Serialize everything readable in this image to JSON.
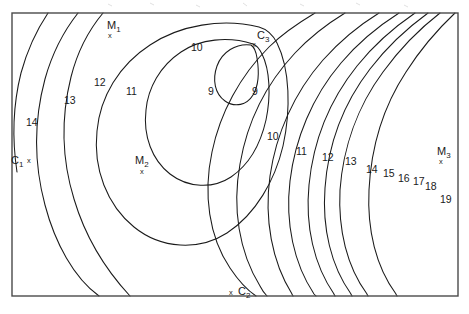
{
  "figure": {
    "type": "contour-map",
    "background_color": "#ffffff",
    "line_color": "#1a1a1a",
    "frame_color": "#4a4a4a",
    "width": 469,
    "height": 314
  },
  "chart_data": {
    "type": "contour",
    "title": "",
    "xlabel": "",
    "ylabel": "",
    "grid": false,
    "legend": "none",
    "axes_visible": false,
    "tick_labels": [],
    "frame": {
      "x": 12,
      "y": 13,
      "width": 446,
      "height": 283
    },
    "contour_levels": [
      9,
      10,
      11,
      12,
      13,
      14,
      15,
      16,
      17,
      18,
      19
    ],
    "level_min": 9,
    "level_max": 19,
    "level_step": 1,
    "inline_labels": [
      {
        "text": "M",
        "sub": "1",
        "x": 107,
        "y": 20,
        "kind": "marker",
        "marker_x": 108,
        "marker_y": 32
      },
      {
        "text": "C",
        "sub": "3",
        "x": 257,
        "y": 30,
        "kind": "marker",
        "marker_x": 252,
        "marker_y": 41
      },
      {
        "text": "C",
        "sub": "1",
        "x": 11,
        "y": 155,
        "kind": "marker",
        "marker_x": 27,
        "marker_y": 157
      },
      {
        "text": "M",
        "sub": "2",
        "x": 135,
        "y": 155,
        "kind": "marker",
        "marker_x": 140,
        "marker_y": 168
      },
      {
        "text": "C",
        "sub": "2",
        "x": 238,
        "y": 286,
        "kind": "marker",
        "marker_x": 229,
        "marker_y": 289
      },
      {
        "text": "M",
        "sub": "3",
        "x": 437,
        "y": 146,
        "kind": "marker",
        "marker_x": 439,
        "marker_y": 158
      },
      {
        "text": "9",
        "sub": "",
        "x": 208,
        "y": 86,
        "kind": "level"
      },
      {
        "text": "9",
        "sub": "",
        "x": 252,
        "y": 86,
        "kind": "level"
      },
      {
        "text": "10",
        "sub": "",
        "x": 191,
        "y": 42,
        "kind": "level"
      },
      {
        "text": "10",
        "sub": "",
        "x": 267,
        "y": 131,
        "kind": "level"
      },
      {
        "text": "11",
        "sub": "",
        "x": 126,
        "y": 86,
        "kind": "level"
      },
      {
        "text": "11",
        "sub": "",
        "x": 296,
        "y": 146,
        "kind": "level"
      },
      {
        "text": "12",
        "sub": "",
        "x": 94,
        "y": 77,
        "kind": "level"
      },
      {
        "text": "12",
        "sub": "",
        "x": 322,
        "y": 152,
        "kind": "level"
      },
      {
        "text": "13",
        "sub": "",
        "x": 64,
        "y": 95,
        "kind": "level"
      },
      {
        "text": "13",
        "sub": "",
        "x": 345,
        "y": 156,
        "kind": "level"
      },
      {
        "text": "14",
        "sub": "",
        "x": 26,
        "y": 117,
        "kind": "level"
      },
      {
        "text": "14",
        "sub": "",
        "x": 366,
        "y": 164,
        "kind": "level"
      },
      {
        "text": "15",
        "sub": "",
        "x": 383,
        "y": 168,
        "kind": "level"
      },
      {
        "text": "16",
        "sub": "",
        "x": 398,
        "y": 173,
        "kind": "level"
      },
      {
        "text": "17",
        "sub": "",
        "x": 413,
        "y": 176,
        "kind": "level"
      },
      {
        "text": "18",
        "sub": "",
        "x": 425,
        "y": 181,
        "kind": "level"
      },
      {
        "text": "19",
        "sub": "",
        "x": 440,
        "y": 194,
        "kind": "level"
      }
    ],
    "markers": [
      {
        "name": "M1",
        "label": "M",
        "subscript": "1",
        "symbol": "x"
      },
      {
        "name": "C3",
        "label": "C",
        "subscript": "3",
        "symbol": "x"
      },
      {
        "name": "C1",
        "label": "C",
        "subscript": "1",
        "symbol": "x"
      },
      {
        "name": "M2",
        "label": "M",
        "subscript": "2",
        "symbol": "x"
      },
      {
        "name": "C2",
        "label": "C",
        "subscript": "2",
        "symbol": "x"
      },
      {
        "name": "M3",
        "label": "M",
        "subscript": "3",
        "symbol": "x"
      }
    ],
    "contour_paths": [
      {
        "level": 9,
        "closed": true,
        "d": "M 251 45 C 236 43 222 52 217 66 C 212 80 215 94 225 101 C 235 108 247 105 253 95 C 259 85 259 70 257 58 C 256 51 254 47 251 45 Z"
      },
      {
        "level": 10,
        "closed": true,
        "d": "M 253 44 C 228 36 200 39 181 52 C 160 66 148 88 146 110 C 143 136 152 160 170 174 C 188 188 213 189 231 177 C 250 164 261 142 266 120 C 271 96 270 70 262 54 C 259 48 256 45 253 44 Z"
      },
      {
        "level": 11,
        "closed": true,
        "d": "M 259 27 C 222 18 180 25 150 45 C 119 65 100 97 97 131 C 93 169 107 205 134 227 C 161 249 199 251 227 233 C 256 214 275 180 283 146 C 291 110 290 69 277 43 C 272 33 266 29 259 27 Z"
      },
      {
        "level": 12,
        "closed": false,
        "d": "M 315 13 C 300 22 283 33 269 47 C 240 76 220 113 212 152 C 203 194 209 237 230 268 C 238 280 247 290 256 296"
      },
      {
        "level": 12.0,
        "closed": false,
        "d": "M 103 13 C 88 31 77 53 71 77 C 61 117 62 160 74 199 C 85 236 105 269 130 296"
      },
      {
        "level": 13,
        "closed": false,
        "d": "M 345 13 C 327 24 310 37 295 53 C 266 84 247 123 240 164 C 232 208 239 252 260 286 C 262 290 264 293 267 296"
      },
      {
        "level": 13.0,
        "closed": false,
        "d": "M 78 13 C 63 32 52 54 45 79 C 34 120 34 164 45 205 C 55 243 74 278 99 296"
      },
      {
        "level": 14,
        "closed": false,
        "d": "M 379 13 C 358 26 339 42 323 60 C 294 93 276 134 270 176 C 264 219 272 262 292 294 C 292 295 293 295 293 296"
      },
      {
        "level": 14.0,
        "closed": false,
        "d": "M 48 13 C 36 31 27 51 21 73 C 13 105 12 139 17 172"
      },
      {
        "level": 15,
        "closed": false,
        "d": "M 399 13 C 377 27 357 44 341 63 C 312 97 295 139 290 181 C 285 223 294 264 314 294 C 315 295 315 295 316 296"
      },
      {
        "level": 16,
        "closed": false,
        "d": "M 415 13 C 393 28 373 46 357 66 C 329 101 313 143 309 185 C 305 226 314 265 334 294 C 334 295 335 295 335 296"
      },
      {
        "level": 17,
        "closed": false,
        "d": "M 428 13 C 406 29 386 48 370 69 C 343 104 328 146 325 188 C 322 228 331 266 351 294 C 351 295 352 295 352 296"
      },
      {
        "level": 18,
        "closed": false,
        "d": "M 440 13 C 418 30 399 50 383 72 C 357 107 343 149 340 190 C 338 230 347 267 367 294 C 367 295 368 295 368 296"
      },
      {
        "level": 19,
        "closed": false,
        "d": "M 455 13 C 437 30 420 50 406 72 C 383 107 371 149 369 190 C 367 230 376 267 396 294 C 396 295 397 295 397 296"
      }
    ]
  }
}
